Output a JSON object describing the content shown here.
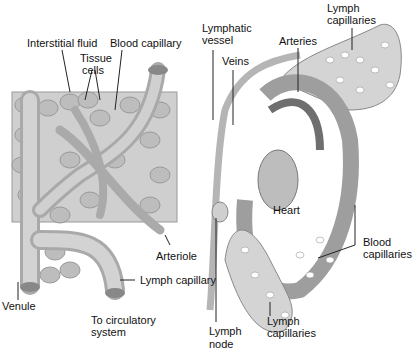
{
  "left_panel": {
    "labels": {
      "interstitial_fluid": "Interstitial fluid",
      "blood_capillary": "Blood capillary",
      "tissue_cells_1": "Tissue",
      "tissue_cells_2": "cells",
      "arteriole": "Arteriole",
      "lymph_capillary": "Lymph capillary",
      "venule": "Venule",
      "to_circ_1": "To circulatory",
      "to_circ_2": "system"
    }
  },
  "right_panel": {
    "labels": {
      "lymphatic_vessel_1": "Lymphatic",
      "lymphatic_vessel_2": "vessel",
      "lymph_capillaries_top_1": "Lymph",
      "lymph_capillaries_top_2": "capillaries",
      "arteries": "Arteries",
      "veins": "Veins",
      "heart": "Heart",
      "blood_capillaries_1": "Blood",
      "blood_capillaries_2": "capillaries",
      "lymph_node_1": "Lymph",
      "lymph_node_2": "node",
      "lymph_capillaries_bottom_1": "Lymph",
      "lymph_capillaries_bottom_2": "capillaries"
    }
  },
  "colors": {
    "tissue": "#c9c9c9",
    "vessel": "#b8b8b8",
    "artery_dark": "#7a7a7a",
    "lymph": "#d6d6d6"
  }
}
